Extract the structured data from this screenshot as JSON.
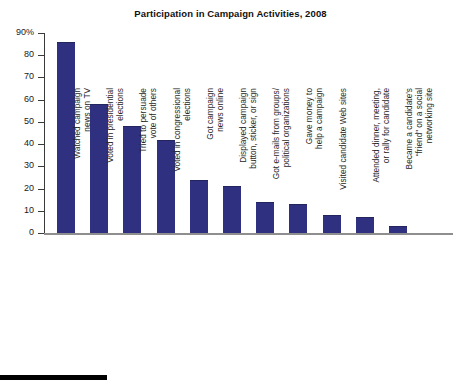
{
  "chart_data": {
    "type": "bar",
    "title": "Participation in Campaign Activities, 2008",
    "xlabel": "",
    "ylabel": "",
    "ylim": [
      0,
      90
    ],
    "grid": false,
    "legend": null,
    "y_ticks": [
      "90%",
      "80",
      "70",
      "60",
      "50",
      "40",
      "30",
      "20",
      "10",
      "0"
    ],
    "y_tick_values": [
      90,
      80,
      70,
      60,
      50,
      40,
      30,
      20,
      10,
      0
    ],
    "categories": [
      "Watched campaign\nnews on TV",
      "Voted in presidential\nelections",
      "Tried to persuade\nvote of others",
      "Voted in congressional\nelections",
      "Got campaign\nnews online",
      "Displayed campaign\nbutton, sticker, or sign",
      "Got e-mails from groups/\npolitical organizations",
      "Gave money to\nhelp a campaign",
      "Visited candidate Web sites",
      "Attended dinner, meeting,\nor rally for candidate",
      "Became a candidate's\n“friend” on a social\nnetworking site"
    ],
    "values": [
      86,
      58,
      48,
      42,
      24,
      21,
      14,
      13,
      8,
      7,
      3
    ],
    "bar_color": "#2f3180",
    "axis_color": "#3a3a3a",
    "baseline_color": "#8e8e8e"
  }
}
